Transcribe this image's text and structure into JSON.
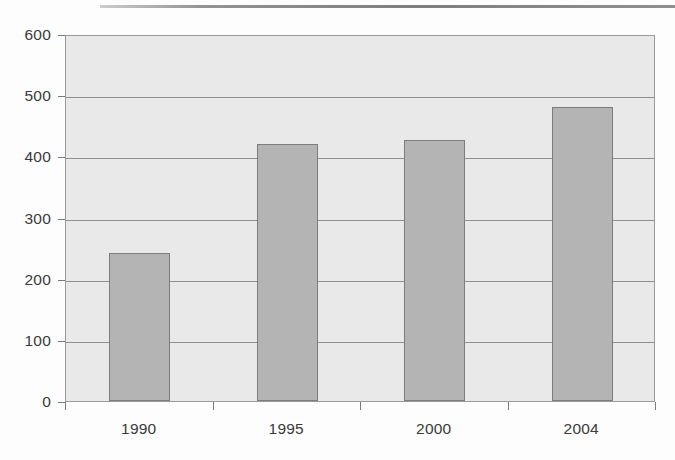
{
  "chart_data": {
    "type": "bar",
    "title": "",
    "subtitle": "",
    "xlabel": "",
    "ylabel": "",
    "categories": [
      "1990",
      "1995",
      "2000",
      "2004"
    ],
    "values": [
      242,
      421,
      426,
      481
    ],
    "series": [
      {
        "name": "",
        "values": [
          242,
          421,
          426,
          481
        ]
      }
    ],
    "ylim": [
      0,
      600
    ],
    "ytick_labels": [
      "0",
      "100",
      "200",
      "300",
      "400",
      "500",
      "600"
    ],
    "ytick_values": [
      0,
      100,
      200,
      300,
      400,
      500,
      600
    ],
    "grid": true,
    "grid_axis": "y",
    "legend": false,
    "legend_position": "none",
    "annotations": [],
    "colors": {
      "bar_fill": "#b4b4b4",
      "bar_border": "#7d7d7d",
      "plot_background": "#e9e9e9",
      "gridline": "#8f8f8f",
      "axis_line": "#9a9a9a",
      "tick_label": "#3a3a3a",
      "page_background": "#fdfdfd"
    }
  }
}
